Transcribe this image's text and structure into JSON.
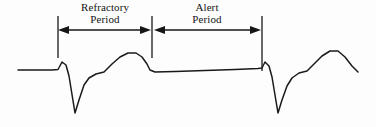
{
  "figure": {
    "background_color": "#fdfdfd",
    "stroke_color": "#1a1a1a",
    "text_color": "#141414"
  },
  "annotations": {
    "refractory": {
      "line1": "Refractory",
      "line2": "Period",
      "span_start_x": 58,
      "span_end_x": 152
    },
    "alert": {
      "line1": "Alert",
      "line2": "Period",
      "span_start_x": 152,
      "span_end_x": 262
    }
  },
  "markers": {
    "ticks": [
      {
        "name": "left-boundary",
        "x": 58,
        "y_top": 16,
        "y_bottom": 58
      },
      {
        "name": "middle-boundary",
        "x": 152,
        "y_top": 16,
        "y_bottom": 58
      },
      {
        "name": "right-boundary",
        "x": 262,
        "y_top": 16,
        "y_bottom": 71
      }
    ],
    "arrow_baseline_y": 30
  },
  "chart_data": {
    "type": "line",
    "xlabel": "",
    "ylabel": "",
    "grid": false,
    "legend": "none",
    "xlim": [
      0,
      376
    ],
    "ylim": [
      127,
      0
    ],
    "series": [
      {
        "name": "ecg-waveform",
        "description": "Two-beat electrocardiogram trace: baseline, R spike, deep S wave, T wave, flat segment, second beat",
        "points": [
          [
            18,
            70
          ],
          [
            52,
            70
          ],
          [
            58,
            69.5
          ],
          [
            62,
            62
          ],
          [
            66,
            65
          ],
          [
            69,
            76
          ],
          [
            75,
            113
          ],
          [
            79,
            100
          ],
          [
            84,
            85
          ],
          [
            89,
            78
          ],
          [
            96,
            74
          ],
          [
            104,
            72
          ],
          [
            112,
            64
          ],
          [
            120,
            57
          ],
          [
            128,
            53
          ],
          [
            136,
            53
          ],
          [
            142,
            57
          ],
          [
            147,
            64
          ],
          [
            150,
            70
          ],
          [
            155,
            72
          ],
          [
            175,
            71.5
          ],
          [
            205,
            70.5
          ],
          [
            235,
            69.5
          ],
          [
            258,
            68.5
          ],
          [
            262,
            68
          ],
          [
            265,
            62
          ],
          [
            269,
            66
          ],
          [
            272,
            77
          ],
          [
            278,
            113
          ],
          [
            282,
            100
          ],
          [
            287,
            86
          ],
          [
            292,
            78
          ],
          [
            299,
            73
          ],
          [
            307,
            71
          ],
          [
            314,
            64
          ],
          [
            322,
            56
          ],
          [
            330,
            51
          ],
          [
            338,
            51
          ],
          [
            345,
            57
          ],
          [
            352,
            66
          ],
          [
            358,
            72
          ]
        ]
      }
    ]
  }
}
